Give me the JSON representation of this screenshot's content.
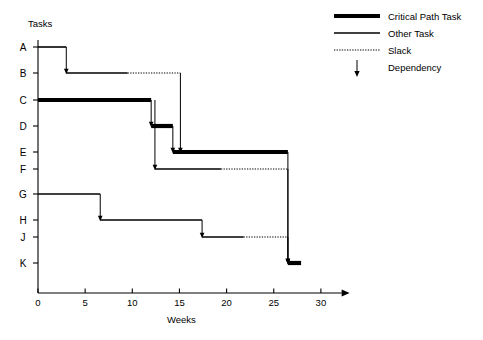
{
  "chart_data": {
    "type": "bar",
    "chart_kind": "gantt",
    "title": "",
    "xlabel": "Weeks",
    "ylabel": "Tasks",
    "xlim": [
      0,
      32
    ],
    "xticks": [
      0,
      5,
      10,
      15,
      20,
      25,
      30
    ],
    "xtick_labels": [
      "0",
      "5",
      "10",
      "15",
      "20",
      "25",
      "30"
    ],
    "grid": false,
    "categories": [
      "A",
      "B",
      "C",
      "D",
      "E",
      "F",
      "G",
      "H",
      "J",
      "K"
    ],
    "legend_position": "top-right",
    "legend": [
      {
        "key": "critical",
        "label": "Critical Path Task",
        "style": "thick-solid-line"
      },
      {
        "key": "other",
        "label": "Other Task",
        "style": "thin-solid-line"
      },
      {
        "key": "slack",
        "label": "Slack",
        "style": "dotted-line"
      },
      {
        "key": "dependency",
        "label": "Dependency",
        "style": "down-arrow"
      }
    ],
    "tasks": [
      {
        "id": "A",
        "start": 0.0,
        "end": 3.0,
        "critical": false,
        "slack_end": null
      },
      {
        "id": "B",
        "start": 3.0,
        "end": 9.5,
        "critical": false,
        "slack_end": 15.1
      },
      {
        "id": "C",
        "start": 0.0,
        "end": 12.0,
        "critical": true,
        "slack_end": null
      },
      {
        "id": "D",
        "start": 12.0,
        "end": 14.3,
        "critical": true,
        "slack_end": null
      },
      {
        "id": "E",
        "start": 14.3,
        "end": 26.5,
        "critical": true,
        "slack_end": null
      },
      {
        "id": "F",
        "start": 12.4,
        "end": 19.4,
        "critical": false,
        "slack_end": 26.5
      },
      {
        "id": "G",
        "start": 0.0,
        "end": 6.6,
        "critical": false,
        "slack_end": null
      },
      {
        "id": "H",
        "start": 6.6,
        "end": 17.4,
        "critical": false,
        "slack_end": null
      },
      {
        "id": "J",
        "start": 17.4,
        "end": 21.8,
        "critical": false,
        "slack_end": 26.5
      },
      {
        "id": "K",
        "start": 26.5,
        "end": 27.9,
        "critical": true,
        "slack_end": null
      }
    ],
    "dependencies": [
      {
        "from": "A",
        "to": "B",
        "week": 3.0
      },
      {
        "from": "C",
        "to": "D",
        "week": 12.0
      },
      {
        "from": "C",
        "to": "F",
        "week": 12.4
      },
      {
        "from": "B",
        "to": "E",
        "week": 15.1
      },
      {
        "from": "D",
        "to": "E",
        "week": 14.3
      },
      {
        "from": "G",
        "to": "H",
        "week": 6.6
      },
      {
        "from": "H",
        "to": "J",
        "week": 17.4
      },
      {
        "from": "E",
        "to": "K",
        "week": 26.5
      },
      {
        "from": "F",
        "to": "K",
        "week": 26.5
      },
      {
        "from": "J",
        "to": "K",
        "week": 26.5
      }
    ]
  }
}
